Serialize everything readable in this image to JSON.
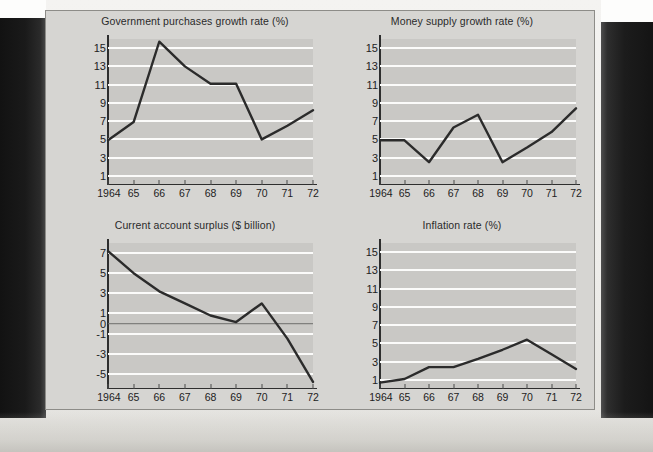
{
  "figure": {
    "panel_bg": "#d6d5d2",
    "plot_bg": "#c9c8c5",
    "gridline_color": "#fbfbfa",
    "line_color": "#2b2b2b"
  },
  "chart_data": [
    {
      "type": "line",
      "title": "Government purchases growth rate (%)",
      "xlabel": "",
      "ylabel": "",
      "categories": [
        "1964",
        "65",
        "66",
        "67",
        "68",
        "69",
        "70",
        "71",
        "72"
      ],
      "yticks": [
        15,
        13,
        11,
        9,
        7,
        5,
        3,
        1
      ],
      "ylim": [
        0,
        16
      ],
      "xlim": [
        "1964",
        "72"
      ],
      "grid": true,
      "legend": "none",
      "series": [
        {
          "name": "Government purchases growth rate",
          "values": [
            4.9,
            6.9,
            15.7,
            13.0,
            11.1,
            11.1,
            5.0,
            6.5,
            8.2
          ]
        }
      ]
    },
    {
      "type": "line",
      "title": "Money supply growth rate (%)",
      "xlabel": "",
      "ylabel": "",
      "categories": [
        "1964",
        "65",
        "66",
        "67",
        "68",
        "69",
        "70",
        "71",
        "72"
      ],
      "yticks": [
        15,
        13,
        11,
        9,
        7,
        5,
        3,
        1
      ],
      "ylim": [
        0,
        16
      ],
      "xlim": [
        "1964",
        "72"
      ],
      "grid": true,
      "legend": "none",
      "series": [
        {
          "name": "Money supply growth rate",
          "values": [
            4.9,
            4.9,
            2.5,
            6.3,
            7.7,
            2.5,
            4.1,
            5.8,
            8.4
          ]
        }
      ]
    },
    {
      "type": "line",
      "title": "Current account surplus ($ billion)",
      "xlabel": "",
      "ylabel": "",
      "categories": [
        "1964",
        "65",
        "66",
        "67",
        "68",
        "69",
        "70",
        "71",
        "72"
      ],
      "yticks": [
        7,
        5,
        3,
        1,
        0,
        -1,
        -3,
        -5
      ],
      "ylim": [
        -6.5,
        8
      ],
      "xlim": [
        "1964",
        "72"
      ],
      "grid": true,
      "zero_line": 0,
      "legend": "none",
      "series": [
        {
          "name": "Current account surplus",
          "values": [
            7.2,
            5.0,
            3.2,
            2.0,
            0.8,
            0.15,
            2.0,
            -1.5,
            -5.8
          ]
        }
      ]
    },
    {
      "type": "line",
      "title": "Inflation rate (%)",
      "xlabel": "",
      "ylabel": "",
      "categories": [
        "1964",
        "65",
        "66",
        "67",
        "68",
        "69",
        "70",
        "71",
        "72"
      ],
      "yticks": [
        15,
        13,
        11,
        9,
        7,
        5,
        3,
        1
      ],
      "ylim": [
        0,
        16
      ],
      "xlim": [
        "1964",
        "72"
      ],
      "grid": true,
      "legend": "none",
      "series": [
        {
          "name": "Inflation rate",
          "values": [
            0.7,
            1.1,
            2.4,
            2.4,
            3.3,
            4.3,
            5.4,
            3.8,
            2.2
          ]
        }
      ]
    }
  ]
}
